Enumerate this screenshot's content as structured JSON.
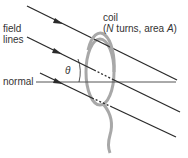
{
  "labels": {
    "field_lines_1": "field",
    "field_lines_2": "lines",
    "normal": "normal",
    "theta": "θ",
    "coil_1": "coil",
    "coil_2_open": "(",
    "coil_2_N": "N",
    "coil_2_mid": " turns, area ",
    "coil_2_A": "A",
    "coil_2_close": ")"
  },
  "colors": {
    "line": "#2a2a2a",
    "coil": "#a8a8a8",
    "normal": "#555555",
    "text": "#333333"
  }
}
